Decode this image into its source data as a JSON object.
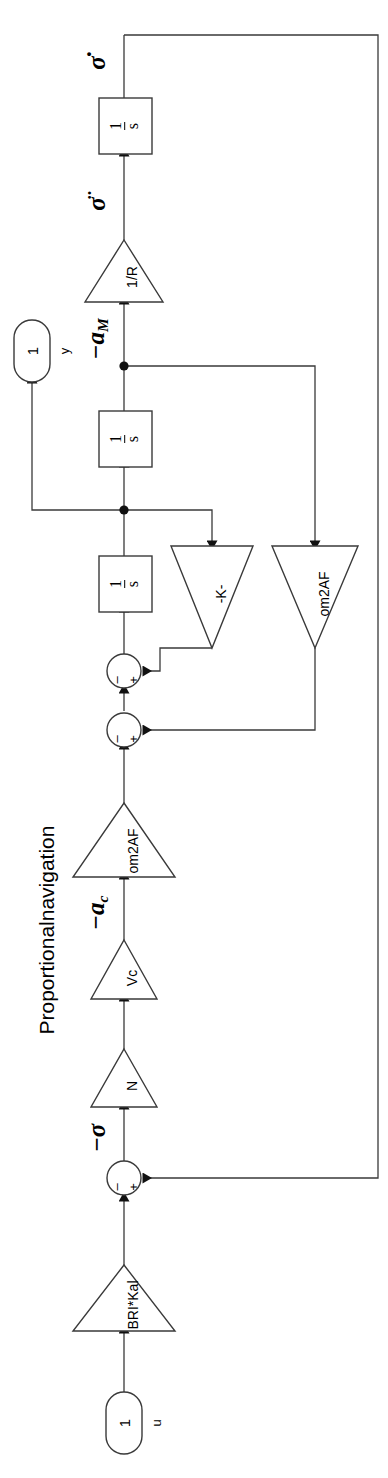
{
  "diagram": {
    "title": "Proportionalnavigation",
    "type": "simulink-block-diagram",
    "orientation": "rotated-90-ccw",
    "canvas": {
      "width": 388,
      "height": 1478
    },
    "line_color": "#3a3a3a",
    "fill_color": "#ffffff"
  },
  "ports": {
    "input": {
      "number": "1",
      "label": "u"
    },
    "output": {
      "number": "1",
      "label": "y"
    }
  },
  "blocks": {
    "gain_bri_kal": {
      "label": "BRI*Kal",
      "kind": "gain-triangle"
    },
    "gain_n": {
      "label": "N",
      "kind": "gain-triangle"
    },
    "gain_vc": {
      "label": "Vc",
      "kind": "gain-triangle"
    },
    "gain_om2af_fwd": {
      "label": "om2AF",
      "kind": "gain-triangle"
    },
    "gain_om2af_fb": {
      "label": "om2AF",
      "kind": "gain-triangle"
    },
    "gain_k": {
      "label": "-K-",
      "kind": "gain-triangle"
    },
    "gain_inv_r": {
      "label": "1/R",
      "kind": "gain-triangle"
    },
    "integrator_1": {
      "numerator": "1",
      "denominator": "s",
      "kind": "integrator"
    },
    "integrator_2": {
      "numerator": "1",
      "denominator": "s",
      "kind": "integrator"
    },
    "integrator_3": {
      "numerator": "1",
      "denominator": "s",
      "kind": "integrator"
    },
    "sum_1": {
      "plus": "+",
      "minus": "–",
      "kind": "sum-junction"
    },
    "sum_2": {
      "plus": "+",
      "minus": "–",
      "kind": "sum-junction"
    },
    "sum_3": {
      "plus": "+",
      "minus": "–",
      "kind": "sum-junction"
    }
  },
  "signals": {
    "sigma_dot_top": {
      "base": "σ",
      "accent": "dot",
      "text": "σ̇"
    },
    "sigma_ddot": {
      "base": "σ",
      "accent": "ddot",
      "text": "σ̈"
    },
    "minus_a_m": {
      "text": "−a",
      "sub": "M"
    },
    "minus_a_c": {
      "text": "−a",
      "sub": "c"
    },
    "minus_sigma_dot": {
      "text": "−σ",
      "accent": "dot"
    }
  }
}
